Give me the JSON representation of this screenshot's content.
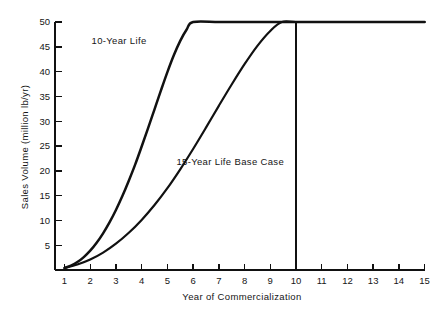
{
  "chart_data": {
    "type": "line",
    "title": "",
    "xlabel": "Year of Commercialization",
    "ylabel": "Sales Volume (million lb/yr)",
    "xlim": [
      0.6,
      15
    ],
    "ylim": [
      0,
      50
    ],
    "xticks": [
      1,
      2,
      3,
      4,
      5,
      6,
      7,
      8,
      9,
      10,
      11,
      12,
      13,
      14,
      15
    ],
    "xtick_labels": [
      "1",
      "2",
      "3",
      "4",
      "5",
      "6",
      "7",
      "8",
      "9",
      "10",
      "11",
      "12",
      "13",
      "14",
      "15"
    ],
    "yticks": [
      5,
      10,
      15,
      20,
      25,
      30,
      35,
      40,
      45,
      50
    ],
    "ytick_labels": [
      "5",
      "10",
      "15",
      "20",
      "25",
      "30",
      "35",
      "40",
      "45",
      "50"
    ],
    "grid": false,
    "legend_position": "inline-annotations",
    "line_color": "#111111",
    "axis_color": "#111111",
    "background_color": "#ffffff",
    "series": [
      {
        "name": "10-Year Life",
        "label_text": "10-Year Life",
        "label_x": 2.05,
        "label_y": 45.6,
        "plateau_value": 50,
        "plateau_start_year": 6.0,
        "plateau_end_year": 15.0,
        "x": [
          1.0,
          1.25,
          1.5,
          1.75,
          2.0,
          2.25,
          2.5,
          2.75,
          3.0,
          3.25,
          3.5,
          3.75,
          4.0,
          4.25,
          4.5,
          4.75,
          5.0,
          5.25,
          5.5,
          5.75,
          6.0,
          7.0,
          8.0,
          9.0,
          10.0,
          11.0,
          12.0,
          13.0,
          14.0,
          15.0
        ],
        "y": [
          0.4,
          0.9,
          1.6,
          2.6,
          3.9,
          5.5,
          7.4,
          9.6,
          12.1,
          14.9,
          18.0,
          21.3,
          24.9,
          28.6,
          32.4,
          36.2,
          39.9,
          43.3,
          46.2,
          48.5,
          50.0,
          50.0,
          50.0,
          50.0,
          50.0,
          50.0,
          50.0,
          50.0,
          50.0,
          50.0
        ]
      },
      {
        "name": "15-Year Life Base Case",
        "label_text": "15-Year Life Base Case",
        "label_x": 5.35,
        "label_y": 21.2,
        "plateau_value": 50,
        "plateau_start_year": 9.45,
        "plateau_end_year": 15.0,
        "x": [
          1.0,
          1.5,
          2.0,
          2.5,
          3.0,
          3.5,
          4.0,
          4.5,
          5.0,
          5.5,
          6.0,
          6.5,
          7.0,
          7.5,
          8.0,
          8.5,
          9.0,
          9.45,
          10.0,
          11.0,
          12.0,
          13.0,
          14.0,
          15.0
        ],
        "y": [
          0.4,
          1.1,
          2.1,
          3.5,
          5.3,
          7.5,
          10.1,
          13.1,
          16.5,
          20.3,
          24.4,
          28.7,
          33.1,
          37.4,
          41.5,
          45.2,
          48.2,
          50.0,
          50.0,
          50.0,
          50.0,
          50.0,
          50.0,
          50.0
        ]
      }
    ],
    "annotations": [
      {
        "name": "cutoff-line",
        "type": "vline",
        "x": 10,
        "y_from": 0,
        "y_to": 50
      }
    ]
  }
}
